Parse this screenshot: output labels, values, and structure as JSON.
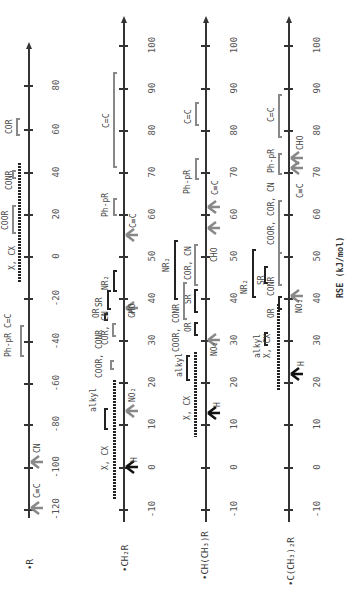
{
  "axis_label": "RSE (kJ/mol)",
  "scales": [
    {
      "radical": "•R",
      "ticks": [
        "80",
        "60",
        "40",
        "20",
        "0",
        "-20",
        "-40",
        "-60",
        "-80",
        "-100",
        "-120"
      ],
      "groups": [
        {
          "label": "COR",
          "range": [
            58,
            65
          ],
          "style": "gray-bracket"
        },
        {
          "label": "CONR",
          "range": [
            40,
            42
          ],
          "style": "gray-bracket"
        },
        {
          "label": "COOR",
          "range": [
            21,
            28
          ],
          "style": "gray-bracket"
        },
        {
          "label": "X, CX",
          "range": [
            -13,
            43
          ],
          "style": "dotted"
        },
        {
          "label": "Ph-pR C=C",
          "range": [
            -45,
            -32
          ],
          "style": "gray-bracket"
        }
      ],
      "arrows": [
        {
          "label": "CN",
          "value": -95
        },
        {
          "label": "C≡C",
          "value": -118
        }
      ]
    },
    {
      "radical": "•CH₂R",
      "ticks": [
        "100",
        "90",
        "80",
        "70",
        "60",
        "50",
        "40",
        "30",
        "20",
        "10",
        "0",
        "-10"
      ],
      "groups": [
        {
          "label": "C=C",
          "range": [
            71,
            93
          ],
          "style": "gray-bracket"
        },
        {
          "label": "Ph-pR",
          "range": [
            61,
            64
          ],
          "style": "gray-bracket"
        },
        {
          "label": "NR₂",
          "range": [
            43,
            46
          ],
          "style": "dark-bracket"
        },
        {
          "label": "SR",
          "range": [
            38,
            42
          ],
          "style": "dark-bracket"
        },
        {
          "label": "OR",
          "range": [
            33,
            34
          ],
          "style": "dark-bracket"
        },
        {
          "label": "COR, CN",
          "range": [
            31,
            33
          ],
          "style": "gray-bracket"
        },
        {
          "label": "COOR, CONR",
          "range": [
            22,
            24
          ],
          "style": "gray-bracket"
        },
        {
          "label": "alkyl",
          "range": [
            9,
            13
          ],
          "style": "dark-bracket"
        },
        {
          "label": "X, CX",
          "range": [
            -7,
            21
          ],
          "style": "dotted"
        }
      ],
      "arrows": [
        {
          "label": "C≡C",
          "value": 52
        },
        {
          "label": "CHO",
          "value": 38
        },
        {
          "label": "NO₂",
          "value": 14
        },
        {
          "label": "H",
          "value": 0
        }
      ]
    },
    {
      "radical": "•CH(CH₃)R",
      "ticks": [
        "100",
        "90",
        "80",
        "70",
        "60",
        "50",
        "40",
        "30",
        "20",
        "10",
        "0",
        "-10"
      ],
      "groups": [
        {
          "label": "C=C",
          "range": [
            81,
            85
          ],
          "style": "gray-bracket"
        },
        {
          "label": "Ph-pR",
          "range": [
            71,
            74
          ],
          "style": "gray-bracket"
        },
        {
          "label": "NR₂",
          "range": [
            45,
            53
          ],
          "style": "dark-bracket"
        },
        {
          "label": "COR, CN",
          "range": [
            45,
            53
          ],
          "style": "gray-bracket"
        },
        {
          "label": "SR",
          "range": [
            39,
            42
          ],
          "style": "dark-bracket"
        },
        {
          "label": "COOR, CONR",
          "range": [
            37,
            41
          ],
          "style": "gray-bracket"
        },
        {
          "label": "OR",
          "range": [
            33,
            34
          ],
          "style": "dark-bracket"
        },
        {
          "label": "alkyl",
          "range": [
            21,
            24
          ],
          "style": "dark-bracket"
        },
        {
          "label": "X, CX",
          "range": [
            9,
            29
          ],
          "style": "dotted"
        }
      ],
      "arrows": [
        {
          "label": "C≡C",
          "value": 62
        },
        {
          "label": "CHO",
          "value": 57
        },
        {
          "label": "NO₂",
          "value": 30
        },
        {
          "label": "H",
          "value": 13
        }
      ]
    },
    {
      "radical": "•C(CH₃)₂R",
      "ticks": [
        "100",
        "90",
        "80",
        "70",
        "60",
        "50",
        "40",
        "30",
        "20",
        "10",
        "0",
        "-10"
      ],
      "groups": [
        {
          "label": "C=C",
          "range": [
            80,
            89
          ],
          "style": "gray-bracket"
        },
        {
          "label": "Ph-pR",
          "range": [
            70,
            74
          ],
          "style": "gray-bracket"
        },
        {
          "label": "COOR, COR, CN",
          "range": [
            50,
            63
          ],
          "style": "gray-bracket"
        },
        {
          "label": "NR₂",
          "range": [
            39,
            50
          ],
          "style": "dark-bracket"
        },
        {
          "label": "SR",
          "range": [
            39,
            50
          ],
          "style": "dark-bracket"
        },
        {
          "label": "CONR",
          "range": [
            43,
            46
          ],
          "style": "dark-bracket"
        },
        {
          "label": "OR",
          "range": [
            39,
            40
          ],
          "style": "dark-bracket"
        },
        {
          "label": "alkyl",
          "range": [
            27,
            29
          ],
          "style": "dark-bracket"
        },
        {
          "label": "X, CX",
          "range": [
            19,
            39
          ],
          "style": "dotted"
        }
      ],
      "arrows": [
        {
          "label": "C≡C",
          "value": 71
        },
        {
          "label": "CHO",
          "value": 73
        },
        {
          "label": "NO₂",
          "value": 41
        },
        {
          "label": "H",
          "value": 22
        }
      ]
    }
  ]
}
